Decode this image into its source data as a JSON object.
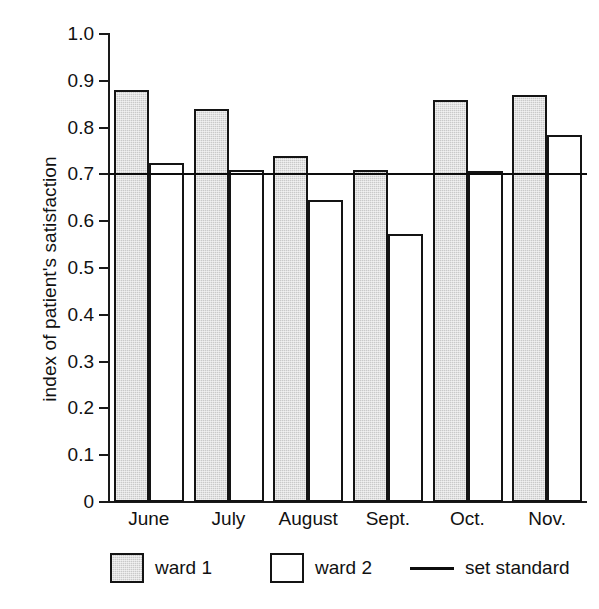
{
  "chart_data": {
    "type": "bar",
    "title": "",
    "subtitle": "",
    "xlabel": "",
    "ylabel": "index of patient's satisfaction",
    "categories": [
      "June",
      "July",
      "August",
      "Sept.",
      "Oct.",
      "Nov."
    ],
    "series": [
      {
        "name": "ward 1",
        "style": "shaded",
        "color": "#c9c9c9",
        "values": [
          0.88,
          0.84,
          0.74,
          0.71,
          0.86,
          0.87
        ]
      },
      {
        "name": "ward 2",
        "style": "open",
        "color": "#ffffff",
        "values": [
          0.725,
          0.71,
          0.645,
          0.573,
          0.708,
          0.785
        ]
      }
    ],
    "reference_line": {
      "name": "set standard",
      "value": 0.7,
      "color": "#0d0d0d"
    },
    "ylim": [
      0,
      1.0
    ],
    "ytick_labels": [
      "1.0",
      "0.9",
      "0.8",
      "0.7",
      "0.6",
      "0.5",
      "0.4",
      "0.3",
      "0.2",
      "0.1",
      "0"
    ],
    "ytick_values": [
      1.0,
      0.9,
      0.8,
      0.7,
      0.6,
      0.5,
      0.4,
      0.3,
      0.2,
      0.1,
      0
    ],
    "grid": false,
    "legend_position": "below"
  },
  "legend": {
    "entries": [
      {
        "label": "ward 1",
        "kind": "swatch-shaded"
      },
      {
        "label": "ward 2",
        "kind": "swatch-open"
      },
      {
        "label": "set standard",
        "kind": "line"
      }
    ]
  }
}
